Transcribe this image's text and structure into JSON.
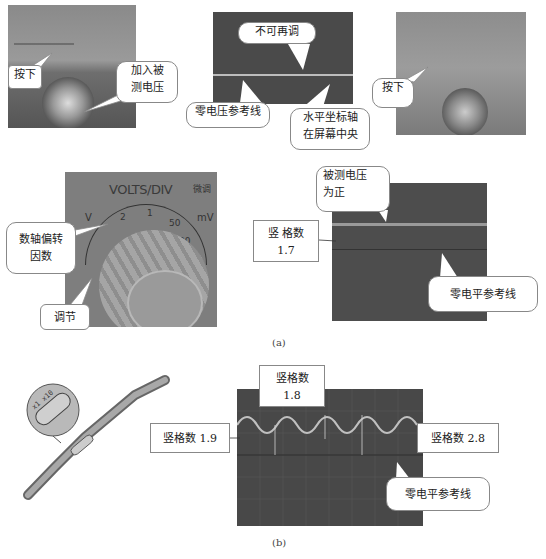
{
  "figure_a": {
    "caption": "(a)",
    "panel1": {
      "callouts": [
        "按下",
        "加入被\n测电压"
      ],
      "label_press": "按下",
      "label_input_line1": "加入被",
      "label_input_line2": "测电压"
    },
    "panel2": {
      "label_no_adjust": "不可再调",
      "label_zero_ref": "零电压参考线",
      "label_axis_line1": "水平坐标轴",
      "label_axis_line2": "在屏幕中央"
    },
    "panel3": {
      "label_press": "按下"
    },
    "panel4": {
      "knob_title": "VOLTS/DIV",
      "knob_side_label": "微调",
      "knob_scale_v": "V",
      "knob_scale_mv": "mV",
      "knob_ticks": [
        "2",
        "1",
        "50",
        "20"
      ],
      "label_factor_line1": "数轴偏转",
      "label_factor_line2": "因数",
      "label_adjust": "调节"
    },
    "panel5": {
      "label_positive_line1": "被测电压",
      "label_positive_line2": "为正",
      "label_divisions_line1": "竖 格数",
      "label_divisions_line2": "1.7",
      "label_zero_level": "零电平参考线"
    }
  },
  "figure_b": {
    "caption": "(b)",
    "probe": {
      "badge_text": "x1 x10"
    },
    "scope": {
      "label_top_line1": "竖格数",
      "label_top_line2": "1.8",
      "label_left": "竖格数   1.9",
      "label_right": "竖格数   2.8",
      "label_zero_level": "零电平参考线"
    }
  },
  "colors": {
    "screen_dark": "#4a4a4a",
    "photo_gray": "#7d7d7d",
    "trace": "#c8c8c8",
    "callout_border": "#888888"
  }
}
